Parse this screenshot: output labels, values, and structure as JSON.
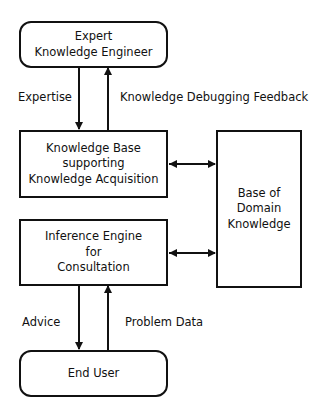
{
  "diagram": {
    "nodes": {
      "expert": {
        "lines": [
          "Expert",
          "Knowledge Engineer"
        ]
      },
      "knowledge_base": {
        "lines": [
          "Knowledge Base",
          "supporting",
          "Knowledge Acquisition"
        ]
      },
      "inference_engine": {
        "lines": [
          "Inference Engine",
          "for",
          "Consultation"
        ]
      },
      "domain_knowledge": {
        "lines": [
          "Base of",
          "Domain",
          "Knowledge"
        ]
      },
      "end_user": {
        "lines": [
          "End User"
        ]
      }
    },
    "edges": {
      "expertise": "Expertise",
      "debugging_feedback": "Knowledge Debugging Feedback",
      "advice": "Advice",
      "problem_data": "Problem Data"
    },
    "colors": {
      "stroke": "#111111",
      "background": "#ffffff"
    }
  }
}
